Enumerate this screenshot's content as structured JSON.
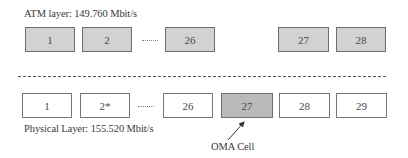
{
  "atm_layer": {
    "title": "ATM layer: 149.760 Mbit/s",
    "cells": [
      {
        "label": "1"
      },
      {
        "label": "2"
      },
      {
        "label": "26"
      },
      {
        "label": "27"
      },
      {
        "label": "28"
      }
    ],
    "fill_color": "#d2d2d2"
  },
  "physical_layer": {
    "title": "Physical Layer: 155.520 Mbit/s",
    "cells": [
      {
        "label": "1"
      },
      {
        "label": "2*"
      },
      {
        "label": "26"
      },
      {
        "label": "27"
      },
      {
        "label": "28"
      },
      {
        "label": "29"
      }
    ],
    "fill_color": "#ffffff"
  },
  "annotation": {
    "oma_label": "OMA Cell",
    "points_to_cell": "27"
  }
}
